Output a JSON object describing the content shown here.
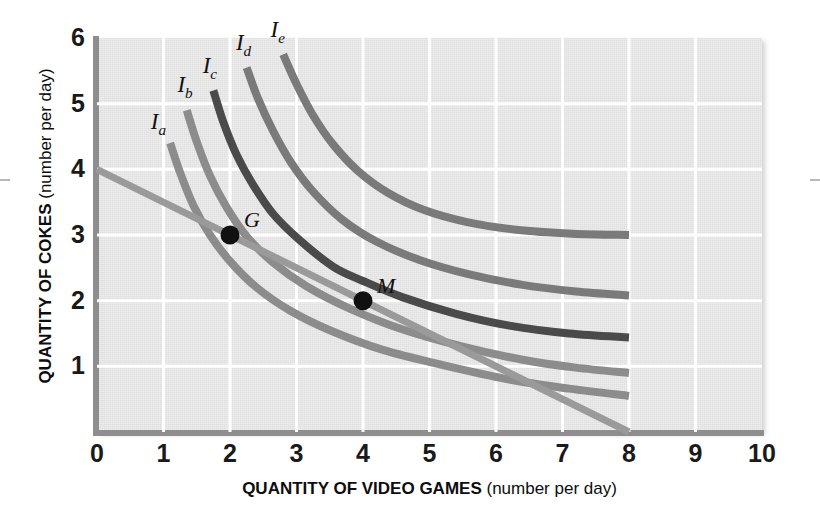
{
  "chart_data": {
    "type": "line",
    "title": "",
    "xlabel": "QUANTITY OF VIDEO GAMES",
    "xlabel_unit": "(number per day)",
    "ylabel": "QUANTITY OF COKES",
    "ylabel_unit": "(number per day)",
    "xlim": [
      0,
      10
    ],
    "ylim": [
      0,
      6
    ],
    "xticks": [
      "0",
      "1",
      "2",
      "3",
      "4",
      "5",
      "6",
      "7",
      "8",
      "9",
      "10"
    ],
    "yticks": [
      "1",
      "2",
      "3",
      "4",
      "5",
      "6"
    ],
    "grid": true,
    "legend_position": "inline-curve-labels",
    "series": [
      {
        "name": "Ia",
        "label": "I",
        "subscript": "a",
        "color": "#8c8c8c",
        "kind": "indifference-curve",
        "label_x": 1.02,
        "label_y": 4.72,
        "points": [
          [
            1.1,
            4.4
          ],
          [
            1.25,
            3.95
          ],
          [
            1.45,
            3.45
          ],
          [
            1.7,
            3.0
          ],
          [
            2.0,
            2.6
          ],
          [
            2.4,
            2.2
          ],
          [
            2.9,
            1.85
          ],
          [
            3.5,
            1.55
          ],
          [
            4.3,
            1.25
          ],
          [
            5.2,
            1.02
          ],
          [
            6.2,
            0.8
          ],
          [
            7.1,
            0.66
          ],
          [
            8.0,
            0.55
          ]
        ]
      },
      {
        "name": "Ib",
        "label": "I",
        "subscript": "b",
        "color": "#8c8c8c",
        "kind": "indifference-curve",
        "label_x": 1.42,
        "label_y": 5.28,
        "points": [
          [
            1.35,
            4.9
          ],
          [
            1.5,
            4.42
          ],
          [
            1.7,
            3.9
          ],
          [
            1.95,
            3.42
          ],
          [
            2.25,
            2.98
          ],
          [
            2.65,
            2.58
          ],
          [
            3.15,
            2.22
          ],
          [
            3.8,
            1.88
          ],
          [
            4.6,
            1.56
          ],
          [
            5.5,
            1.3
          ],
          [
            6.4,
            1.1
          ],
          [
            7.2,
            0.98
          ],
          [
            8.0,
            0.9
          ]
        ]
      },
      {
        "name": "Ic",
        "label": "I",
        "subscript": "c",
        "color": "#4a4a4a",
        "kind": "indifference-curve",
        "label_x": 1.8,
        "label_y": 5.58,
        "points": [
          [
            1.75,
            5.2
          ],
          [
            1.9,
            4.72
          ],
          [
            2.1,
            4.22
          ],
          [
            2.35,
            3.76
          ],
          [
            2.65,
            3.32
          ],
          [
            3.05,
            2.92
          ],
          [
            3.55,
            2.52
          ],
          [
            4.0,
            2.3
          ],
          [
            4.6,
            2.05
          ],
          [
            5.4,
            1.8
          ],
          [
            6.2,
            1.62
          ],
          [
            7.1,
            1.5
          ],
          [
            8.0,
            1.44
          ]
        ]
      },
      {
        "name": "Id",
        "label": "I",
        "subscript": "d",
        "color": "#7a7a7a",
        "kind": "indifference-curve",
        "label_x": 2.3,
        "label_y": 5.92,
        "points": [
          [
            2.25,
            5.55
          ],
          [
            2.42,
            5.08
          ],
          [
            2.65,
            4.58
          ],
          [
            2.92,
            4.1
          ],
          [
            3.25,
            3.66
          ],
          [
            3.68,
            3.24
          ],
          [
            4.2,
            2.9
          ],
          [
            4.85,
            2.62
          ],
          [
            5.6,
            2.4
          ],
          [
            6.4,
            2.24
          ],
          [
            7.2,
            2.14
          ],
          [
            8.0,
            2.08
          ]
        ]
      },
      {
        "name": "Ie",
        "label": "I",
        "subscript": "e",
        "color": "#7a7a7a",
        "kind": "indifference-curve",
        "label_x": 2.82,
        "label_y": 6.12,
        "points": [
          [
            2.8,
            5.75
          ],
          [
            3.0,
            5.3
          ],
          [
            3.25,
            4.82
          ],
          [
            3.55,
            4.38
          ],
          [
            3.92,
            3.98
          ],
          [
            4.38,
            3.64
          ],
          [
            4.92,
            3.38
          ],
          [
            5.55,
            3.2
          ],
          [
            6.3,
            3.08
          ],
          [
            7.15,
            3.02
          ],
          [
            8.0,
            3.0
          ]
        ]
      },
      {
        "name": "budget-line",
        "label": "",
        "subscript": "",
        "color": "#9a9a9a",
        "kind": "budget-line",
        "label_x": null,
        "label_y": null,
        "points": [
          [
            0.0,
            4.0
          ],
          [
            8.0,
            0.0
          ]
        ]
      }
    ],
    "annotations": [
      {
        "name": "G",
        "label": "G",
        "x": 2.0,
        "y": 3.0,
        "label_dx": 14,
        "label_dy": -26
      },
      {
        "name": "M",
        "label": "M",
        "x": 4.0,
        "y": 2.0,
        "label_dx": 14,
        "label_dy": -26
      }
    ]
  }
}
